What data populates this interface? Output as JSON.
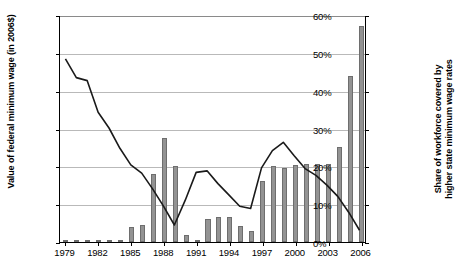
{
  "chart_data": {
    "type": "bar",
    "title": "",
    "subtitle": "",
    "xlabel": "",
    "ylabel": "Value of federal minimum wage (in 2006$)",
    "y2label": "Share of workforce covered by higher state minimum wage rates",
    "grid": true,
    "legend": "none",
    "x": [
      1979,
      1980,
      1981,
      1982,
      1983,
      1984,
      1985,
      1986,
      1987,
      1988,
      1989,
      1990,
      1991,
      1992,
      1993,
      1994,
      1995,
      1996,
      1997,
      1998,
      1999,
      2000,
      2001,
      2002,
      2003,
      2004,
      2005,
      2006
    ],
    "x_tick_labels": [
      "1979",
      "1982",
      "1985",
      "1988",
      "1991",
      "1994",
      "1997",
      "2000",
      "2003",
      "2006"
    ],
    "x_tick_values": [
      1979,
      1982,
      1985,
      1988,
      1991,
      1994,
      1997,
      2000,
      2003,
      2006
    ],
    "ylim": [
      5.0,
      8.0
    ],
    "y_ticks": [
      5.0,
      5.5,
      6.0,
      6.5,
      7.0,
      7.5,
      8.0
    ],
    "y_tick_labels": [
      "$5.00",
      "$5.50",
      "$6.00",
      "$6.50",
      "$7.00",
      "$7.50",
      "$8.00"
    ],
    "y2lim": [
      0,
      60
    ],
    "y2_ticks": [
      0,
      10,
      20,
      30,
      40,
      50,
      60
    ],
    "y2_tick_labels": [
      "0%",
      "10%",
      "20%",
      "30%",
      "40%",
      "50%",
      "60%"
    ],
    "series": [
      {
        "name": "Value of federal minimum wage (in 2006$)",
        "type": "line",
        "axis": "left",
        "color": "#1a1a1a",
        "values": [
          7.43,
          7.18,
          7.14,
          6.72,
          6.51,
          6.24,
          6.02,
          5.91,
          5.7,
          5.47,
          5.22,
          5.55,
          5.92,
          5.94,
          5.77,
          5.62,
          5.47,
          5.44,
          5.98,
          6.21,
          6.32,
          6.14,
          5.97,
          5.88,
          5.75,
          5.6,
          5.39,
          5.15
        ]
      },
      {
        "name": "Share of workforce covered by higher state minimum wage rates",
        "type": "bar",
        "axis": "right",
        "color": "#939393",
        "values": [
          0.2,
          0.2,
          0.2,
          0.2,
          0.2,
          0.6,
          4.0,
          4.4,
          18.0,
          27.5,
          20.0,
          1.8,
          0.2,
          6.2,
          6.6,
          6.6,
          4.2,
          2.8,
          16.0,
          20.0,
          19.5,
          20.4,
          20.5,
          20.5,
          20.5,
          25.0,
          44.0,
          57.0
        ]
      }
    ]
  }
}
